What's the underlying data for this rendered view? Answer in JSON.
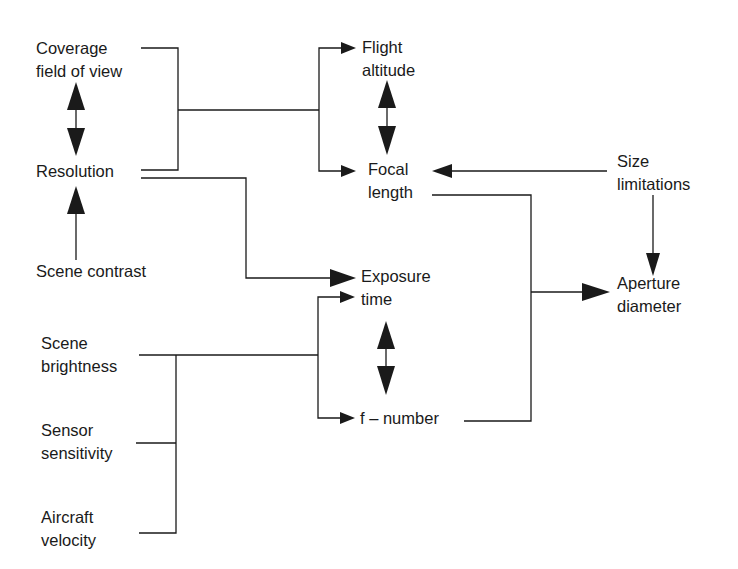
{
  "diagram": {
    "title": "",
    "nodes": {
      "coverage": {
        "line1": "Coverage",
        "line2": "field of view"
      },
      "resolution": {
        "line1": "Resolution"
      },
      "scene_contrast": {
        "line1": "Scene contrast"
      },
      "flight_altitude": {
        "line1": "Flight",
        "line2": "altitude"
      },
      "focal_length": {
        "line1": "Focal",
        "line2": "length"
      },
      "size_limitations": {
        "line1": "Size",
        "line2": "limitations"
      },
      "exposure_time": {
        "line1": "Exposure",
        "line2": "time"
      },
      "f_number": {
        "line1": "f – number"
      },
      "aperture_diameter": {
        "line1": "Aperture",
        "line2": "diameter"
      },
      "scene_brightness": {
        "line1": "Scene",
        "line2": "brightness"
      },
      "sensor_sensitivity": {
        "line1": "Sensor",
        "line2": "sensitivity"
      },
      "aircraft_velocity": {
        "line1": "Aircraft",
        "line2": "velocity"
      }
    },
    "edges": [
      {
        "from": [
          "Coverage field of view",
          "Resolution"
        ],
        "to": [
          "Flight altitude",
          "Focal length"
        ],
        "type": "bracket-arrow"
      },
      {
        "from": "Coverage field of view",
        "to": "Resolution",
        "type": "bidirectional"
      },
      {
        "from": "Scene contrast",
        "to": "Resolution",
        "type": "arrow"
      },
      {
        "from": "Flight altitude",
        "to": "Focal length",
        "type": "bidirectional"
      },
      {
        "from": "Size limitations",
        "to": "Focal length",
        "type": "arrow"
      },
      {
        "from": "Size limitations",
        "to": "Aperture diameter",
        "type": "arrow"
      },
      {
        "from": "Resolution",
        "to": "Exposure time",
        "type": "arrow"
      },
      {
        "from": [
          "Scene brightness",
          "Sensor sensitivity",
          "Aircraft velocity"
        ],
        "to": [
          "Exposure time",
          "f – number"
        ],
        "type": "bracket-arrow"
      },
      {
        "from": "Exposure time",
        "to": "f – number",
        "type": "bidirectional"
      },
      {
        "from": [
          "Focal length",
          "f – number"
        ],
        "to": "Aperture diameter",
        "type": "bracket-arrow"
      }
    ],
    "colors": {
      "line": "#1a1a1a",
      "background": "#ffffff"
    }
  }
}
